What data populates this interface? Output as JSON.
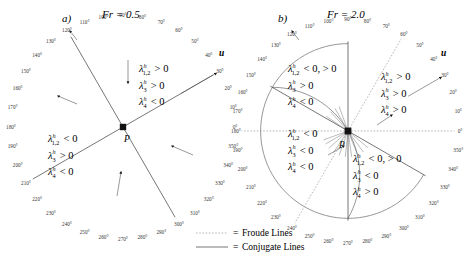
{
  "figure": {
    "kind": "two-panel-polar-eigenvalue-sign-diagram",
    "background": "#ffffff",
    "colors": {
      "conjugate_line": "#4a4a4a",
      "froude_line": "#9a9a9a",
      "arc": "#6a6a6a",
      "text": "#000000",
      "tick_text": "#333333"
    }
  },
  "panels": [
    {
      "id": "a",
      "label": "a)",
      "title": "Fr = 0.5",
      "center_label": "P",
      "velocity_label": "u",
      "velocity_angle_deg": 30,
      "conjugate_lines_deg": [
        30,
        120
      ],
      "froude_lines_deg": [],
      "sector_annotations": [
        {
          "position": "upper-right",
          "lines": [
            {
              "sym": "λ",
              "sub": "1,2",
              "sup": "h",
              "rel": "> 0"
            },
            {
              "sym": "λ",
              "sub": "3",
              "sup": "h",
              "rel": "> 0"
            },
            {
              "sym": "λ",
              "sub": "4",
              "sup": "h",
              "rel": "< 0"
            }
          ]
        },
        {
          "position": "lower-left",
          "lines": [
            {
              "sym": "λ",
              "sub": "1,2",
              "sup": "h",
              "rel": "< 0"
            },
            {
              "sym": "λ",
              "sub": "3",
              "sup": "h",
              "rel": "> 0"
            },
            {
              "sym": "λ",
              "sub": "4",
              "sup": "h",
              "rel": "< 0"
            }
          ]
        }
      ],
      "tick_labels": [
        "0°",
        "10°",
        "20°",
        "30°",
        "40°",
        "50°",
        "60°",
        "70°",
        "80°",
        "90°",
        "100°",
        "110°",
        "120°",
        "130°",
        "140°",
        "150°",
        "160°",
        "170°",
        "180°",
        "190°",
        "200°",
        "210°",
        "220°",
        "230°",
        "240°",
        "250°",
        "260°",
        "270°",
        "280°",
        "290°",
        "300°",
        "310°",
        "320°",
        "330°",
        "340°",
        "350°"
      ]
    },
    {
      "id": "b",
      "label": "b)",
      "title": "Fr = 2.0",
      "center_label": "P",
      "velocity_label": "u",
      "velocity_angle_deg": 30,
      "conjugate_lines_deg": [
        150,
        330,
        90,
        270
      ],
      "froude_lines_deg": [
        60,
        240,
        0,
        180
      ],
      "sector_annotations": [
        {
          "position": "upper-left",
          "lines": [
            {
              "sym": "λ",
              "sub": "1,2",
              "sup": "h",
              "rel": "< 0, > 0"
            },
            {
              "sym": "λ",
              "sub": "3",
              "sup": "h",
              "rel": "> 0"
            },
            {
              "sym": "λ",
              "sub": "4",
              "sup": "h",
              "rel": "< 0"
            }
          ]
        },
        {
          "position": "upper-right",
          "lines": [
            {
              "sym": "λ",
              "sub": "1,2",
              "sup": "h",
              "rel": "> 0"
            },
            {
              "sym": "λ",
              "sub": "3",
              "sup": "h",
              "rel": "> 0"
            },
            {
              "sym": "λ",
              "sub": "4",
              "sup": "h",
              "rel": "> 0"
            }
          ]
        },
        {
          "position": "lower-left",
          "lines": [
            {
              "sym": "λ",
              "sub": "1,2",
              "sup": "h",
              "rel": "< 0"
            },
            {
              "sym": "λ",
              "sub": "3",
              "sup": "h",
              "rel": "< 0"
            },
            {
              "sym": "λ",
              "sub": "4",
              "sup": "h",
              "rel": "< 0"
            }
          ]
        },
        {
          "position": "lower-right",
          "lines": [
            {
              "sym": "λ",
              "sub": "1,2",
              "sup": "h",
              "rel": "< 0, > 0"
            },
            {
              "sym": "λ",
              "sub": "3",
              "sup": "h",
              "rel": "< 0"
            },
            {
              "sym": "λ",
              "sub": "4",
              "sup": "h",
              "rel": "> 0"
            }
          ]
        }
      ],
      "tick_labels": [
        "0°",
        "10°",
        "20°",
        "30°",
        "40°",
        "50°",
        "60°",
        "70°",
        "80°",
        "90°",
        "100°",
        "110°",
        "120°",
        "130°",
        "140°",
        "150°",
        "160°",
        "170°",
        "180°",
        "190°",
        "200°",
        "210°",
        "220°",
        "230°",
        "240°",
        "250°",
        "260°",
        "270°",
        "280°",
        "290°",
        "300°",
        "310°",
        "320°",
        "330°",
        "340°",
        "350°"
      ]
    }
  ],
  "legend": {
    "items": [
      {
        "style": "dotted",
        "equals": "=",
        "label": "Froude Lines"
      },
      {
        "style": "solid",
        "equals": "=",
        "label": "Conjugate Lines"
      }
    ]
  }
}
